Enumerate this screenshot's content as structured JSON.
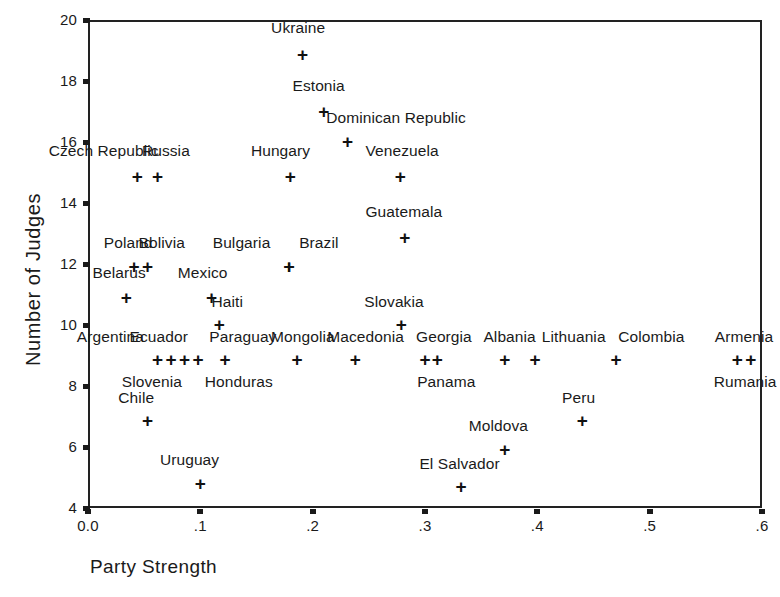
{
  "chart_data": {
    "type": "scatter",
    "title": "",
    "xlabel": "Party Strength",
    "ylabel": "Number of Judges",
    "xlim": [
      0.0,
      0.6
    ],
    "ylim": [
      4,
      20
    ],
    "grid": false,
    "legend": "none",
    "marker": "+",
    "xticks": [
      "0.0",
      ".1",
      ".2",
      ".3",
      ".4",
      ".5",
      ".6"
    ],
    "xtick_values": [
      0.0,
      0.1,
      0.2,
      0.3,
      0.4,
      0.5,
      0.6
    ],
    "yticks": [
      "4",
      "6",
      "8",
      "10",
      "12",
      "14",
      "16",
      "18",
      "20"
    ],
    "ytick_values": [
      4,
      6,
      8,
      10,
      12,
      14,
      16,
      18,
      20
    ],
    "points": [
      {
        "label": "Ukraine",
        "x": 0.191,
        "y": 18.85,
        "lx": 0.163,
        "ly": 19.75
      },
      {
        "label": "Estonia",
        "x": 0.21,
        "y": 17.0,
        "lx": 0.182,
        "ly": 17.85
      },
      {
        "label": "Dominican Republic",
        "x": 0.231,
        "y": 16.0,
        "lx": 0.212,
        "ly": 16.8
      },
      {
        "label": "Czech Republic",
        "x": 0.044,
        "y": 14.85,
        "lx": -0.035,
        "ly": 15.7
      },
      {
        "label": "Russia",
        "x": 0.062,
        "y": 14.85,
        "lx": 0.048,
        "ly": 15.7
      },
      {
        "label": "Hungary",
        "x": 0.18,
        "y": 14.85,
        "lx": 0.145,
        "ly": 15.7
      },
      {
        "label": "Venezuela",
        "x": 0.278,
        "y": 14.85,
        "lx": 0.247,
        "ly": 15.7
      },
      {
        "label": "Guatemala",
        "x": 0.282,
        "y": 12.85,
        "lx": 0.247,
        "ly": 13.7
      },
      {
        "label": "Poland",
        "x": 0.041,
        "y": 11.9,
        "lx": 0.014,
        "ly": 12.7
      },
      {
        "label": "Bolivia",
        "x": 0.053,
        "y": 11.9,
        "lx": 0.045,
        "ly": 12.7
      },
      {
        "label": "Bulgaria",
        "x": 0.179,
        "y": 11.9,
        "lx": 0.111,
        "ly": 12.7
      },
      {
        "label": "Brazil",
        "x": 0.179,
        "y": 11.9,
        "lx": 0.188,
        "ly": 12.7
      },
      {
        "label": "Belarus",
        "x": 0.034,
        "y": 10.9,
        "lx": 0.004,
        "ly": 11.7
      },
      {
        "label": "Mexico",
        "x": 0.11,
        "y": 10.9,
        "lx": 0.08,
        "ly": 11.7
      },
      {
        "label": "Haiti",
        "x": 0.117,
        "y": 10.0,
        "lx": 0.11,
        "ly": 10.75
      },
      {
        "label": "Slovakia",
        "x": 0.279,
        "y": 10.0,
        "lx": 0.246,
        "ly": 10.75
      },
      {
        "label": "Argentina",
        "x": 0.062,
        "y": 8.85,
        "lx": -0.01,
        "ly": 9.62
      },
      {
        "label": "Ecuador",
        "x": 0.074,
        "y": 8.85,
        "lx": 0.037,
        "ly": 9.62
      },
      {
        "label": "Slovenia",
        "x": 0.086,
        "y": 8.85,
        "lx": 0.03,
        "ly": 8.12
      },
      {
        "label": "Paraguay",
        "x": 0.098,
        "y": 8.85,
        "lx": 0.108,
        "ly": 9.62
      },
      {
        "label": "Honduras",
        "x": 0.122,
        "y": 8.85,
        "lx": 0.104,
        "ly": 8.12
      },
      {
        "label": "Mongolia",
        "x": 0.186,
        "y": 8.85,
        "lx": 0.163,
        "ly": 9.62
      },
      {
        "label": "Macedonia",
        "x": 0.238,
        "y": 8.85,
        "lx": 0.213,
        "ly": 9.62
      },
      {
        "label": "Georgia",
        "x": 0.3,
        "y": 8.85,
        "lx": 0.292,
        "ly": 9.62
      },
      {
        "label": "Panama",
        "x": 0.311,
        "y": 8.85,
        "lx": 0.293,
        "ly": 8.12
      },
      {
        "label": "Albania",
        "x": 0.371,
        "y": 8.85,
        "lx": 0.352,
        "ly": 9.62
      },
      {
        "label": "Lithuania",
        "x": 0.398,
        "y": 8.85,
        "lx": 0.404,
        "ly": 9.62
      },
      {
        "label": "Colombia",
        "x": 0.47,
        "y": 8.85,
        "lx": 0.472,
        "ly": 9.62
      },
      {
        "label": "Armenia",
        "x": 0.578,
        "y": 8.85,
        "lx": 0.558,
        "ly": 9.62
      },
      {
        "label": "Rumania",
        "x": 0.59,
        "y": 8.85,
        "lx": 0.557,
        "ly": 8.12
      },
      {
        "label": "Chile",
        "x": 0.053,
        "y": 6.85,
        "lx": 0.027,
        "ly": 7.62
      },
      {
        "label": "Peru",
        "x": 0.44,
        "y": 6.85,
        "lx": 0.422,
        "ly": 7.62
      },
      {
        "label": "Moldova",
        "x": 0.371,
        "y": 5.9,
        "lx": 0.339,
        "ly": 6.68
      },
      {
        "label": "Uruguay",
        "x": 0.1,
        "y": 4.8,
        "lx": 0.064,
        "ly": 5.58
      },
      {
        "label": "El Salvador",
        "x": 0.332,
        "y": 4.7,
        "lx": 0.295,
        "ly": 5.45
      }
    ]
  },
  "axes": {
    "x_label": "Party Strength",
    "y_label": "Number of Judges"
  }
}
